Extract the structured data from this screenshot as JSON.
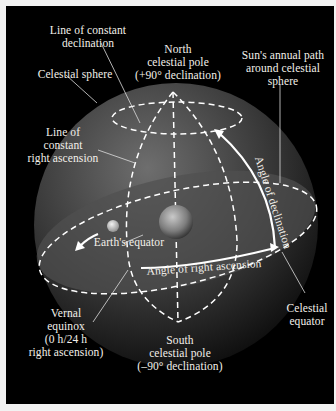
{
  "figure": {
    "colors": {
      "background": "#000000",
      "frame": "#f2f2f2",
      "sphere": "#5a5a5a",
      "lines": "#ffffff",
      "text": "#f3f0ea"
    }
  },
  "labels": {
    "line_constant_declination": [
      "Line of constant",
      "declination"
    ],
    "north_pole": [
      "North",
      "celestial pole",
      "(+90° declination)"
    ],
    "sun_path": [
      "Sun's annual path",
      "around celestial",
      "sphere"
    ],
    "celestial_sphere": [
      "Celestial sphere"
    ],
    "line_constant_ra": [
      "Line of",
      "constant",
      "right ascension"
    ],
    "angle_declination": "Angle of declination",
    "earths_equator": "Earth's equator",
    "angle_ra": "Angle of right ascension",
    "vernal_equinox": [
      "Vernal",
      "equinox",
      "(0 h/24 h",
      "right ascension)"
    ],
    "south_pole": [
      "South",
      "celestial pole",
      "(–90° declination)"
    ],
    "celestial_equator": [
      "Celestial",
      "equator"
    ]
  }
}
